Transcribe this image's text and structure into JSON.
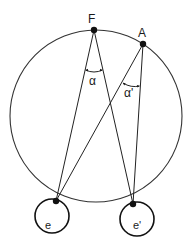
{
  "diagram": {
    "type": "geometric-optics",
    "points": {
      "F": {
        "label": "F",
        "x": 94,
        "y": 30
      },
      "A": {
        "label": "A",
        "x": 143,
        "y": 44
      },
      "e_node": {
        "x": 56,
        "y": 201
      },
      "e_prime_node": {
        "x": 133,
        "y": 204
      }
    },
    "eyes": [
      {
        "id": "left-eye",
        "label": "e",
        "cx": 52,
        "cy": 216,
        "r": 17
      },
      {
        "id": "right-eye",
        "label": "e'",
        "cx": 137,
        "cy": 219,
        "r": 17
      }
    ],
    "angles": [
      {
        "id": "alpha",
        "label": "α",
        "vertex": "F"
      },
      {
        "id": "alpha-prime",
        "label": "α'",
        "vertex": "A"
      }
    ],
    "circle": {
      "name": "vieth-muller-circle",
      "cx": 96,
      "cy": 116,
      "r": 86
    },
    "colors": {
      "ink": "#111111",
      "background": "#ffffff"
    }
  }
}
